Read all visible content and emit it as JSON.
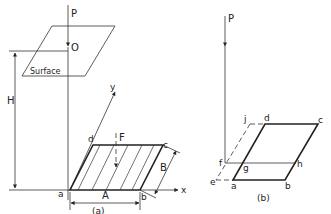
{
  "figure": {
    "panel_a": {
      "caption": "(a)",
      "labels": {
        "load": "P",
        "origin": "O",
        "surface": "Surface",
        "depth": "H",
        "force": "F",
        "corner_a": "a",
        "corner_b": "b",
        "corner_c": "c",
        "corner_d": "d",
        "width": "A",
        "length": "B",
        "axis_x": "x",
        "axis_y": "y"
      }
    },
    "panel_b": {
      "caption": "(b)",
      "labels": {
        "load": "P",
        "corner_a": "a",
        "corner_b": "b",
        "corner_c": "c",
        "corner_d": "d",
        "point_e": "e",
        "point_f": "f",
        "point_g": "g",
        "point_h": "h",
        "point_j": "j"
      }
    }
  }
}
